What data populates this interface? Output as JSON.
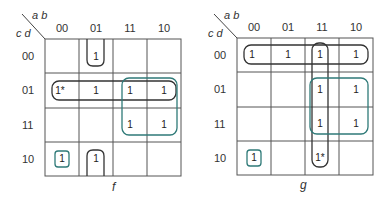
{
  "maps": [
    {
      "name": "f",
      "corner": {
        "top": "a b",
        "left": "c d"
      },
      "columns": [
        "00",
        "01",
        "11",
        "10"
      ],
      "rows": [
        "00",
        "01",
        "11",
        "10"
      ],
      "cells": [
        [
          "",
          "1",
          "",
          ""
        ],
        [
          "1*",
          "1",
          "1",
          "1"
        ],
        [
          "",
          "",
          "1",
          "1"
        ],
        [
          "1",
          "1",
          "",
          ""
        ]
      ],
      "groups": [
        {
          "cells": "col 01 rows 00 & 10 (wrap)",
          "color": "#333333"
        },
        {
          "cells": "row 01 all columns",
          "color": "#333333"
        },
        {
          "cells": "cols 11,10 rows 01,11",
          "color": "#2f7a78"
        },
        {
          "cells": "single 00/10",
          "color": "#2f7a78"
        }
      ]
    },
    {
      "name": "g",
      "corner": {
        "top": "a b",
        "left": "c d"
      },
      "columns": [
        "00",
        "01",
        "11",
        "10"
      ],
      "rows": [
        "00",
        "01",
        "11",
        "10"
      ],
      "cells": [
        [
          "1",
          "1",
          "1",
          "1"
        ],
        [
          "",
          "",
          "1",
          "1"
        ],
        [
          "",
          "",
          "1",
          "1"
        ],
        [
          "1",
          "",
          "1*",
          ""
        ]
      ],
      "groups": [
        {
          "cells": "row 00 all columns",
          "color": "#333333"
        },
        {
          "cells": "column 11 all rows",
          "color": "#333333"
        },
        {
          "cells": "cols 11,10 rows 01,11",
          "color": "#2f7a78"
        },
        {
          "cells": "single 00/10",
          "color": "#2f7a78"
        }
      ]
    }
  ],
  "colors": {
    "grid": "#555555",
    "group_dark": "#333333",
    "group_teal": "#2f7a78"
  }
}
